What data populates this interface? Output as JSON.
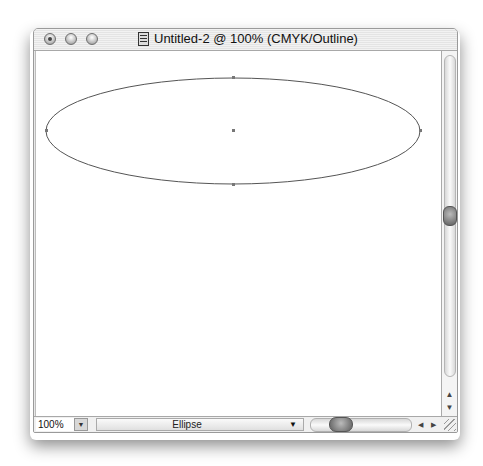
{
  "window": {
    "title": "Untitled-2 @ 100% (CMYK/Outline)",
    "buttons": [
      "close",
      "minimize",
      "zoom"
    ]
  },
  "canvas": {
    "shape": {
      "type": "ellipse",
      "cx": 232,
      "cy": 130,
      "rx": 187,
      "ry": 53,
      "stroke": "#555555",
      "anchor_points": [
        [
          45,
          130
        ],
        [
          232,
          77
        ],
        [
          419,
          130
        ],
        [
          232,
          183
        ]
      ],
      "center_point": [
        232,
        130
      ]
    }
  },
  "statusbar": {
    "zoom_value": "100%",
    "zoom_dropdown_icon": "triangle-down",
    "tool_label": "Ellipse",
    "tool_dropdown_icon": "triangle-down",
    "scroll_left_icon": "◀",
    "scroll_right_icon": "▶"
  },
  "vscroll": {
    "up_icon": "▲",
    "down_icon": "▼"
  }
}
